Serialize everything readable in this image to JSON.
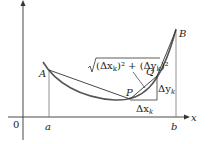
{
  "diagram": {
    "type": "arc-length-approximation",
    "points": {
      "A": "A",
      "B": "B",
      "P": "P",
      "Q": "Q"
    },
    "axes": {
      "origin": "0",
      "x_label": "x",
      "a_label": "a",
      "b_label": "b"
    },
    "annotations": {
      "segment_length": "√((Δx_k)² + (Δy_k)²)",
      "sqrt_body": "(Δx",
      "sub_k1": "k",
      "mid": ")² + (Δy",
      "sub_k2": "k",
      "end": ")²",
      "dx": "Δx",
      "dx_sub": "k",
      "dy": "Δy",
      "dy_sub": "k"
    },
    "colors": {
      "curve": "#555555",
      "lines": "#333333"
    }
  }
}
